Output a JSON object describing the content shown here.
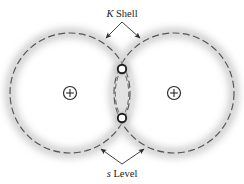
{
  "figure": {
    "name": "overlapping-k-shell-s-level-orbital-diagram",
    "background_color": "#ffffff",
    "width": 244,
    "height": 184
  },
  "labels": {
    "top": {
      "italic_symbol": "K",
      "text": " Shell",
      "full": "K Shell",
      "x": 122,
      "y": 14
    },
    "bottom": {
      "italic_symbol": "s",
      "text": " Level",
      "full": "s Level",
      "x": 122,
      "y": 175
    }
  },
  "colors": {
    "glow": "#d8d8d8",
    "glow_inner": "#ebebeb",
    "orbit_line": "#4a4a4a",
    "node_ring": "#1f1f1f",
    "node_fill": "#ffffff",
    "nucleus_stroke": "#2b2b2b",
    "leader_line": "#2e2e2e",
    "text": "#1b1b1b"
  },
  "geometry": {
    "left_shell": {
      "cx": 70,
      "cy": 93,
      "r": 60
    },
    "right_shell": {
      "cx": 174,
      "cy": 93,
      "r": 60
    },
    "left_nucleus": {
      "cx": 70,
      "cy": 93,
      "r": 6.5
    },
    "right_nucleus": {
      "cx": 174,
      "cy": 93,
      "r": 6.5
    },
    "top_node": {
      "cx": 122,
      "cy": 69,
      "r": 4.2
    },
    "bottom_node": {
      "cx": 122,
      "cy": 118,
      "r": 4.2
    }
  },
  "leaders": {
    "top": {
      "apex": {
        "x": 122,
        "y": 22
      },
      "arrow_left": {
        "x": 104,
        "y": 40
      },
      "arrow_right": {
        "x": 142,
        "y": 40
      }
    },
    "bottom": {
      "apex": {
        "x": 122,
        "y": 165
      },
      "arrow_left": {
        "x": 99,
        "y": 148
      },
      "arrow_right": {
        "x": 146,
        "y": 148
      }
    }
  },
  "annotations": {
    "top_target": "K Shell",
    "bottom_target": "s Level",
    "nucleus_symbol": "+",
    "node_count": 2,
    "shell_count": 2
  }
}
